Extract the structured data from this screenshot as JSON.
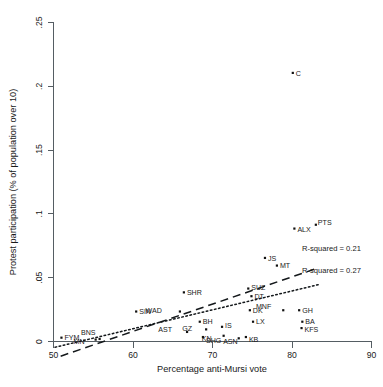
{
  "chart_data": {
    "type": "scatter",
    "title": "",
    "xlabel": "Percentage anti-Mursi vote",
    "ylabel": "Protest participation (% of population over 10)",
    "xlim": [
      50,
      90
    ],
    "ylim": [
      0,
      0.25
    ],
    "xticks": [
      "50",
      "60",
      "70",
      "80",
      "90"
    ],
    "xtick_values": [
      50,
      60,
      70,
      80,
      90
    ],
    "yticks": [
      "0",
      ".05",
      ".1",
      ".15",
      ".2",
      ".25"
    ],
    "ytick_values": [
      0,
      0.05,
      0.1,
      0.15,
      0.2,
      0.25
    ],
    "grid": false,
    "legend_position": "none",
    "points": [
      {
        "label": "FYM",
        "x": 51.0,
        "y": 0.003,
        "lx": 3,
        "ly": 2.6
      },
      {
        "label": "MN",
        "x": 55.3,
        "y": 0.0015,
        "lx": -11,
        "ly": 4.0
      },
      {
        "label": "BNS",
        "x": 55.8,
        "y": 0.002,
        "lx": -4,
        "ly": -3.6
      },
      {
        "label": "SIN",
        "x": 60.4,
        "y": 0.0235,
        "lx": 3,
        "ly": 2.6
      },
      {
        "label": "SHR",
        "x": 66.4,
        "y": 0.0385,
        "lx": 3,
        "ly": 2.6
      },
      {
        "label": "WAD",
        "x": 65.9,
        "y": 0.0235,
        "lx": -18,
        "ly": 1.0
      },
      {
        "label": "AST",
        "x": 66.8,
        "y": 0.0075,
        "lx": -15,
        "ly": 0.5
      },
      {
        "label": "BH",
        "x": 68.4,
        "y": 0.0155,
        "lx": 3,
        "ly": 2.6
      },
      {
        "label": "GZ",
        "x": 69.2,
        "y": 0.0095,
        "lx": -14,
        "ly": 2.0
      },
      {
        "label": "SHG",
        "x": 68.8,
        "y": 0.0035,
        "lx": 3,
        "ly": 6.0
      },
      {
        "label": "IS",
        "x": 71.2,
        "y": 0.0115,
        "lx": 3,
        "ly": 1.6
      },
      {
        "label": "KN",
        "x": 71.4,
        "y": 0.0045,
        "lx": -12,
        "ly": 4.8
      },
      {
        "label": "ASN",
        "x": 73.3,
        "y": 0.0025,
        "lx": -1,
        "ly": 5.4
      },
      {
        "label": "KB",
        "x": 74.2,
        "y": 0.0035,
        "lx": 3,
        "ly": 4.6
      },
      {
        "label": "SUZ",
        "x": 74.5,
        "y": 0.0415,
        "lx": 3,
        "ly": 1.8
      },
      {
        "label": "DT",
        "x": 74.9,
        "y": 0.0355,
        "lx": 3,
        "ly": 3.2
      },
      {
        "label": "DK",
        "x": 74.7,
        "y": 0.0245,
        "lx": 3,
        "ly": 2.6
      },
      {
        "label": "LX",
        "x": 75.1,
        "y": 0.0155,
        "lx": 3,
        "ly": 2.6
      },
      {
        "label": "JS",
        "x": 76.6,
        "y": 0.0655,
        "lx": 3,
        "ly": 2.6
      },
      {
        "label": "MT",
        "x": 78.1,
        "y": 0.0595,
        "lx": 3,
        "ly": 2.6
      },
      {
        "label": "MNF",
        "x": 78.9,
        "y": 0.0245,
        "lx": -12,
        "ly": -1.0
      },
      {
        "label": "GH",
        "x": 80.9,
        "y": 0.0245,
        "lx": 3,
        "ly": 2.6
      },
      {
        "label": "BA",
        "x": 81.3,
        "y": 0.0155,
        "lx": 3,
        "ly": 2.6
      },
      {
        "label": "KFS",
        "x": 81.2,
        "y": 0.0105,
        "lx": 3,
        "ly": 3.4
      },
      {
        "label": "ALX",
        "x": 80.3,
        "y": 0.0885,
        "lx": 3,
        "ly": 3.0
      },
      {
        "label": "PTS",
        "x": 83.0,
        "y": 0.0915,
        "lx": 2,
        "ly": 0.0
      },
      {
        "label": "C",
        "x": 80.1,
        "y": 0.2105,
        "lx": 3,
        "ly": 2.6
      }
    ],
    "fit_lines": [
      {
        "name": "dashed-fit",
        "style": "dashed",
        "annotation": "R-squared = 0.21",
        "r_squared": 0.21,
        "x_start": 50.9,
        "y_start": -0.0115,
        "x_end": 83.2,
        "y_end": 0.0575
      },
      {
        "name": "dotted-fit",
        "style": "dotted",
        "annotation": "R-squared = 0.27",
        "r_squared": 0.27,
        "x_start": 50.2,
        "y_start": -0.0045,
        "x_end": 83.3,
        "y_end": 0.0445
      }
    ]
  },
  "colors": {
    "marker": "#111111",
    "line": "#14181b",
    "axis": "#555d63",
    "background": "#ffffff"
  }
}
